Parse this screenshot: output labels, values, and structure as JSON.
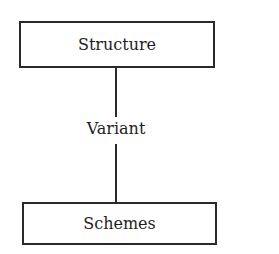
{
  "diagram": {
    "nodes": [
      {
        "id": "structure",
        "label": "Structure"
      },
      {
        "id": "schemes",
        "label": "Schemes"
      }
    ],
    "edges": [
      {
        "from": "structure",
        "to": "schemes",
        "label": "Variant"
      }
    ],
    "colors": {
      "stroke": "#2a2a2a",
      "text": "#1e1e1e",
      "background": "#ffffff"
    }
  }
}
